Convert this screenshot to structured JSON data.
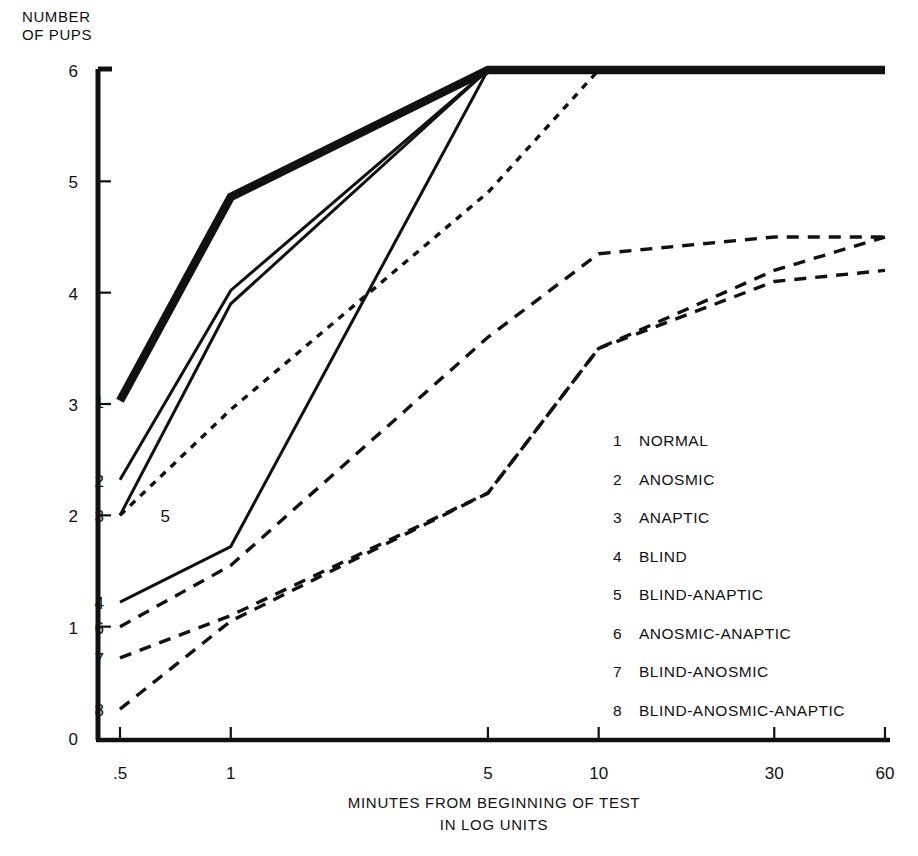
{
  "chart_data": {
    "type": "line",
    "title": "",
    "ylabel_line1": "NUMBER",
    "ylabel_line2": "OF PUPS",
    "xlabel_line1": "MINUTES FROM BEGINNING OF TEST",
    "xlabel_line2": "IN LOG UNITS",
    "xlabel": "MINUTES FROM BEGINNING OF TEST IN LOG UNITS",
    "ylabel": "NUMBER OF PUPS",
    "x_scale": "log",
    "x_ticks": [
      0.5,
      1,
      5,
      10,
      30,
      60
    ],
    "x_tick_labels": [
      ".5",
      "1",
      "5",
      "10",
      "30",
      "60"
    ],
    "y_ticks": [
      0,
      1,
      2,
      3,
      4,
      5,
      6
    ],
    "y_tick_labels": [
      "0",
      "1",
      "2",
      "3",
      "4",
      "5",
      "6"
    ],
    "xlim": [
      0.5,
      60
    ],
    "ylim": [
      0,
      6
    ],
    "grid": false,
    "legend_position": "inside-lower-right",
    "series": [
      {
        "id": "1",
        "name": "NORMAL",
        "style": "solid-thick",
        "x": [
          0.5,
          1,
          5,
          10,
          30,
          60
        ],
        "values": [
          3.03,
          4.86,
          6.0,
          6.0,
          6.0,
          6.0
        ]
      },
      {
        "id": "2",
        "name": "ANOSMIC",
        "style": "solid",
        "x": [
          0.5,
          1,
          5,
          10,
          30,
          60
        ],
        "values": [
          2.32,
          4.02,
          6.0,
          6.0,
          6.0,
          6.0
        ]
      },
      {
        "id": "3",
        "name": "ANAPTIC",
        "style": "solid",
        "x": [
          0.5,
          1,
          5,
          10,
          30,
          60
        ],
        "values": [
          2.0,
          3.9,
          6.0,
          6.0,
          6.0,
          6.0
        ]
      },
      {
        "id": "4",
        "name": "BLIND",
        "style": "solid",
        "x": [
          0.5,
          1,
          5,
          10,
          30,
          60
        ],
        "values": [
          1.22,
          1.72,
          6.0,
          6.0,
          6.0,
          6.0
        ]
      },
      {
        "id": "5",
        "name": "BLIND-ANAPTIC",
        "style": "dotted",
        "x": [
          0.5,
          1,
          5,
          10,
          30,
          60
        ],
        "values": [
          2.0,
          2.95,
          4.9,
          6.0,
          6.0,
          6.0
        ]
      },
      {
        "id": "6",
        "name": "ANOSMIC-ANAPTIC",
        "style": "dashed",
        "x": [
          0.5,
          1,
          5,
          10,
          30,
          60
        ],
        "values": [
          1.0,
          1.55,
          3.6,
          4.35,
          4.5,
          4.5
        ]
      },
      {
        "id": "7",
        "name": "BLIND-ANOSMIC",
        "style": "dashed",
        "x": [
          0.5,
          1,
          5,
          10,
          30,
          60
        ],
        "values": [
          0.72,
          1.1,
          2.2,
          3.5,
          4.2,
          4.5
        ]
      },
      {
        "id": "8",
        "name": "BLIND-ANOSMIC-ANAPTIC",
        "style": "dashed",
        "x": [
          0.5,
          1,
          5,
          10,
          30,
          60
        ],
        "values": [
          0.26,
          1.05,
          2.2,
          3.5,
          4.1,
          4.2
        ]
      }
    ],
    "curve_tags": [
      {
        "id": "1",
        "label": "1"
      },
      {
        "id": "2",
        "label": "2"
      },
      {
        "id": "3",
        "label": "3"
      },
      {
        "id": "4",
        "label": "4"
      },
      {
        "id": "5",
        "label": "5"
      },
      {
        "id": "6",
        "label": "6"
      },
      {
        "id": "7",
        "label": "7"
      },
      {
        "id": "8",
        "label": "8"
      }
    ],
    "legend": [
      {
        "num": "1",
        "label": "NORMAL"
      },
      {
        "num": "2",
        "label": "ANOSMIC"
      },
      {
        "num": "3",
        "label": "ANAPTIC"
      },
      {
        "num": "4",
        "label": "BLIND"
      },
      {
        "num": "5",
        "label": "BLIND-ANAPTIC"
      },
      {
        "num": "6",
        "label": "ANOSMIC-ANAPTIC"
      },
      {
        "num": "7",
        "label": "BLIND-ANOSMIC"
      },
      {
        "num": "8",
        "label": "BLIND-ANOSMIC-ANAPTIC"
      }
    ],
    "colors": {
      "ink": "#111111",
      "background": "#ffffff"
    }
  }
}
